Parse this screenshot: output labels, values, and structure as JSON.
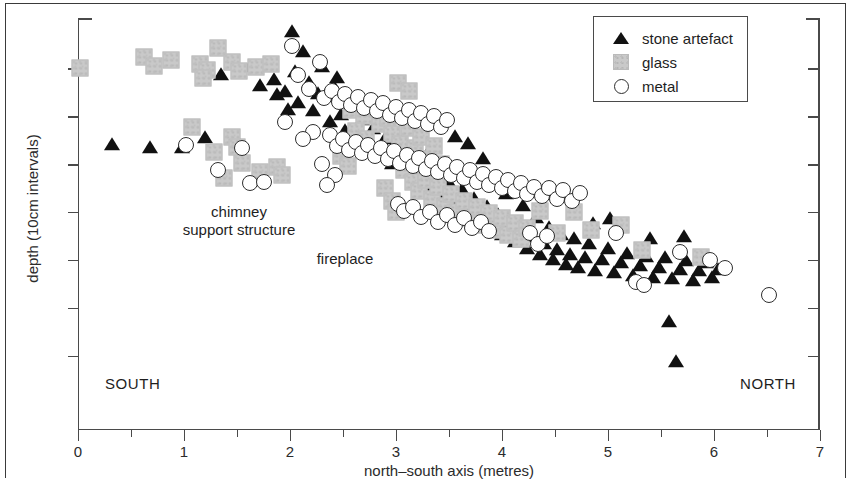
{
  "figure": {
    "x_axis_label": "north–south axis (metres)",
    "y_axis_label": "depth (10cm intervals)",
    "south_label": "SOUTH",
    "north_label": "NORTH"
  },
  "legend": {
    "items": [
      {
        "label": "stone artefact",
        "marker": "triangle-marker",
        "color": "#111111"
      },
      {
        "label": "glass",
        "marker": "square-marker",
        "color": "#c9c9c9"
      },
      {
        "label": "metal",
        "marker": "circle-marker",
        "color": "#ffffff"
      }
    ]
  },
  "annotations": [
    {
      "name": "chimney-support-structure",
      "line1": "chimney",
      "line2": "support structure"
    },
    {
      "name": "fireplace",
      "line1": "fireplace"
    }
  ],
  "chart_data": {
    "type": "scatter",
    "title": "",
    "xlabel": "north–south axis (metres)",
    "ylabel": "depth (10cm intervals)",
    "xlim": [
      0,
      7
    ],
    "ylim": [
      0,
      8.6
    ],
    "y_inverted": true,
    "grid": false,
    "legend_position": "top-right",
    "xticks": [
      0,
      1,
      2,
      3,
      4,
      5,
      6,
      7
    ],
    "xticklabels": [
      "0",
      "1",
      "2",
      "3",
      "4",
      "5",
      "6",
      "7"
    ],
    "xminorticks": [
      0.5,
      1.5,
      2.5,
      3.5,
      4.5,
      5.5,
      6.5
    ],
    "yticks": [
      1.05,
      2.05,
      3.05,
      4.05,
      5.05,
      6.05,
      7.05
    ],
    "yticklabels": [
      "",
      "",
      "",
      "",
      "",
      "",
      ""
    ],
    "series": [
      {
        "name": "stone artefact",
        "marker": "triangle",
        "color": "#111111",
        "points": [
          [
            0.32,
            2.65
          ],
          [
            0.68,
            2.72
          ],
          [
            0.98,
            2.72
          ],
          [
            1.2,
            2.5
          ],
          [
            1.35,
            1.18
          ],
          [
            1.52,
            2.62
          ],
          [
            1.62,
            1.02
          ],
          [
            1.78,
            0.97
          ],
          [
            1.72,
            1.42
          ],
          [
            1.85,
            1.3
          ],
          [
            1.88,
            1.6
          ],
          [
            1.95,
            1.55
          ],
          [
            2.02,
            0.3
          ],
          [
            2.05,
            1.12
          ],
          [
            2.08,
            1.78
          ],
          [
            2.12,
            0.72
          ],
          [
            2.18,
            1.35
          ],
          [
            2.22,
            1.95
          ],
          [
            2.3,
            1.02
          ],
          [
            2.33,
            1.62
          ],
          [
            2.38,
            2.18
          ],
          [
            2.42,
            1.48
          ],
          [
            2.48,
            2.02
          ],
          [
            2.52,
            2.35
          ],
          [
            2.58,
            1.72
          ],
          [
            2.62,
            2.55
          ],
          [
            2.68,
            2.12
          ],
          [
            2.72,
            2.62
          ],
          [
            2.78,
            2.32
          ],
          [
            2.84,
            2.88
          ],
          [
            2.9,
            2.52
          ],
          [
            2.96,
            3.05
          ],
          [
            3.02,
            2.78
          ],
          [
            3.08,
            3.2
          ],
          [
            3.14,
            2.95
          ],
          [
            3.2,
            3.38
          ],
          [
            3.26,
            3.12
          ],
          [
            3.32,
            3.55
          ],
          [
            3.38,
            3.28
          ],
          [
            3.44,
            3.72
          ],
          [
            3.5,
            3.44
          ],
          [
            3.56,
            2.48
          ],
          [
            3.58,
            3.88
          ],
          [
            3.62,
            3.6
          ],
          [
            3.68,
            2.62
          ],
          [
            3.7,
            4.05
          ],
          [
            3.74,
            3.78
          ],
          [
            3.8,
            4.2
          ],
          [
            3.82,
            2.95
          ],
          [
            3.86,
            3.95
          ],
          [
            3.92,
            4.35
          ],
          [
            3.96,
            4.12
          ],
          [
            4.0,
            4.52
          ],
          [
            4.04,
            3.68
          ],
          [
            4.08,
            4.28
          ],
          [
            4.12,
            4.68
          ],
          [
            4.16,
            4.42
          ],
          [
            4.2,
            3.92
          ],
          [
            4.24,
            4.82
          ],
          [
            4.28,
            4.58
          ],
          [
            4.32,
            4.18
          ],
          [
            4.36,
            4.95
          ],
          [
            4.4,
            4.72
          ],
          [
            4.44,
            4.38
          ],
          [
            4.48,
            5.05
          ],
          [
            4.52,
            4.85
          ],
          [
            4.56,
            4.52
          ],
          [
            4.6,
            5.15
          ],
          [
            4.64,
            4.95
          ],
          [
            4.68,
            4.62
          ],
          [
            4.72,
            5.22
          ],
          [
            4.78,
            5.02
          ],
          [
            4.82,
            4.72
          ],
          [
            4.88,
            5.28
          ],
          [
            4.94,
            5.05
          ],
          [
            5.0,
            4.82
          ],
          [
            5.06,
            5.32
          ],
          [
            5.12,
            5.12
          ],
          [
            5.18,
            4.92
          ],
          [
            5.24,
            5.38
          ],
          [
            5.3,
            5.18
          ],
          [
            5.36,
            4.98
          ],
          [
            5.42,
            5.42
          ],
          [
            5.48,
            5.22
          ],
          [
            5.54,
            5.02
          ],
          [
            5.58,
            6.35
          ],
          [
            5.6,
            5.45
          ],
          [
            5.64,
            7.18
          ],
          [
            5.68,
            5.25
          ],
          [
            5.74,
            5.08
          ],
          [
            5.8,
            5.48
          ],
          [
            5.86,
            5.28
          ],
          [
            5.92,
            5.12
          ],
          [
            5.98,
            5.42
          ],
          [
            6.04,
            5.25
          ],
          [
            4.86,
            4.3
          ],
          [
            5.02,
            4.2
          ],
          [
            5.4,
            4.62
          ],
          [
            5.72,
            4.58
          ],
          [
            3.3,
            2.82
          ],
          [
            3.46,
            3.02
          ],
          [
            2.44,
            1.25
          ],
          [
            1.98,
            1.92
          ],
          [
            2.26,
            1.58
          ]
        ]
      },
      {
        "name": "glass",
        "marker": "square",
        "color": "#c9c9c9",
        "points": [
          [
            0.02,
            1.05
          ],
          [
            0.62,
            0.82
          ],
          [
            0.72,
            1.0
          ],
          [
            0.88,
            0.88
          ],
          [
            1.15,
            0.95
          ],
          [
            1.22,
            1.08
          ],
          [
            1.32,
            0.62
          ],
          [
            1.45,
            0.92
          ],
          [
            1.52,
            1.1
          ],
          [
            1.08,
            2.28
          ],
          [
            1.28,
            2.8
          ],
          [
            1.45,
            2.48
          ],
          [
            1.5,
            2.7
          ],
          [
            1.55,
            3.02
          ],
          [
            1.72,
            3.22
          ],
          [
            1.88,
            3.12
          ],
          [
            1.92,
            3.28
          ],
          [
            1.68,
            1.02
          ],
          [
            1.82,
            0.95
          ],
          [
            2.58,
            1.92
          ],
          [
            2.7,
            2.05
          ],
          [
            2.78,
            1.88
          ],
          [
            2.85,
            2.22
          ],
          [
            2.92,
            2.08
          ],
          [
            2.62,
            2.35
          ],
          [
            2.72,
            2.52
          ],
          [
            2.96,
            2.42
          ],
          [
            3.04,
            2.62
          ],
          [
            3.12,
            2.3
          ],
          [
            3.18,
            2.72
          ],
          [
            3.24,
            2.48
          ],
          [
            3.3,
            2.95
          ],
          [
            3.36,
            2.68
          ],
          [
            3.42,
            3.05
          ],
          [
            3.08,
            3.18
          ],
          [
            3.16,
            3.42
          ],
          [
            3.22,
            3.62
          ],
          [
            3.28,
            3.38
          ],
          [
            3.34,
            3.78
          ],
          [
            3.4,
            3.52
          ],
          [
            3.46,
            3.92
          ],
          [
            3.52,
            3.68
          ],
          [
            3.58,
            4.05
          ],
          [
            3.64,
            3.82
          ],
          [
            3.7,
            4.18
          ],
          [
            3.76,
            3.95
          ],
          [
            3.82,
            4.32
          ],
          [
            3.88,
            4.08
          ],
          [
            3.94,
            4.42
          ],
          [
            4.0,
            4.18
          ],
          [
            4.06,
            4.52
          ],
          [
            4.12,
            4.28
          ],
          [
            4.18,
            4.62
          ],
          [
            4.24,
            4.38
          ],
          [
            3.02,
            1.35
          ],
          [
            3.12,
            1.52
          ],
          [
            2.48,
            2.88
          ],
          [
            2.55,
            3.08
          ],
          [
            4.36,
            4.02
          ],
          [
            4.52,
            4.48
          ],
          [
            4.68,
            4.05
          ],
          [
            4.84,
            4.42
          ],
          [
            5.12,
            4.32
          ],
          [
            5.32,
            4.85
          ],
          [
            5.88,
            4.98
          ],
          [
            2.9,
            3.55
          ],
          [
            2.96,
            3.82
          ],
          [
            3.0,
            4.05
          ],
          [
            1.18,
            1.25
          ],
          [
            1.38,
            3.35
          ]
        ]
      },
      {
        "name": "metal",
        "marker": "circle",
        "color": "#ffffff",
        "points": [
          [
            1.02,
            2.65
          ],
          [
            1.32,
            3.18
          ],
          [
            1.62,
            3.45
          ],
          [
            1.75,
            3.42
          ],
          [
            1.55,
            2.72
          ],
          [
            2.02,
            0.58
          ],
          [
            2.28,
            0.92
          ],
          [
            2.18,
            1.48
          ],
          [
            2.32,
            1.68
          ],
          [
            2.4,
            1.52
          ],
          [
            2.46,
            1.75
          ],
          [
            2.52,
            1.58
          ],
          [
            2.58,
            1.82
          ],
          [
            2.64,
            1.65
          ],
          [
            2.7,
            1.88
          ],
          [
            2.76,
            1.72
          ],
          [
            2.82,
            1.95
          ],
          [
            2.88,
            1.78
          ],
          [
            2.94,
            2.02
          ],
          [
            3.0,
            1.85
          ],
          [
            3.06,
            2.08
          ],
          [
            3.12,
            1.92
          ],
          [
            3.18,
            2.15
          ],
          [
            3.24,
            1.98
          ],
          [
            3.3,
            2.22
          ],
          [
            3.36,
            2.05
          ],
          [
            3.42,
            2.28
          ],
          [
            3.48,
            2.12
          ],
          [
            2.38,
            2.45
          ],
          [
            2.44,
            2.68
          ],
          [
            2.5,
            2.52
          ],
          [
            2.56,
            2.75
          ],
          [
            2.62,
            2.58
          ],
          [
            2.68,
            2.82
          ],
          [
            2.74,
            2.65
          ],
          [
            2.8,
            2.88
          ],
          [
            2.86,
            2.72
          ],
          [
            2.92,
            2.95
          ],
          [
            2.98,
            2.78
          ],
          [
            3.04,
            3.02
          ],
          [
            3.1,
            2.85
          ],
          [
            3.16,
            3.08
          ],
          [
            3.22,
            2.92
          ],
          [
            3.28,
            3.15
          ],
          [
            3.34,
            2.98
          ],
          [
            3.4,
            3.22
          ],
          [
            3.46,
            3.05
          ],
          [
            3.52,
            3.28
          ],
          [
            3.58,
            3.12
          ],
          [
            3.64,
            3.35
          ],
          [
            3.7,
            3.18
          ],
          [
            3.76,
            3.42
          ],
          [
            3.82,
            3.25
          ],
          [
            3.88,
            3.48
          ],
          [
            3.94,
            3.32
          ],
          [
            4.0,
            3.55
          ],
          [
            4.06,
            3.38
          ],
          [
            4.12,
            3.62
          ],
          [
            4.18,
            3.45
          ],
          [
            4.24,
            3.68
          ],
          [
            2.22,
            2.38
          ],
          [
            2.3,
            3.05
          ],
          [
            2.42,
            3.28
          ],
          [
            2.35,
            3.48
          ],
          [
            3.02,
            3.88
          ],
          [
            3.08,
            4.02
          ],
          [
            3.16,
            3.95
          ],
          [
            3.24,
            4.15
          ],
          [
            3.32,
            4.05
          ],
          [
            3.4,
            4.25
          ],
          [
            3.48,
            4.12
          ],
          [
            3.56,
            4.32
          ],
          [
            3.64,
            4.18
          ],
          [
            3.72,
            4.38
          ],
          [
            3.8,
            4.25
          ],
          [
            3.88,
            4.45
          ],
          [
            4.3,
            3.52
          ],
          [
            4.38,
            3.72
          ],
          [
            4.44,
            3.55
          ],
          [
            4.52,
            3.78
          ],
          [
            4.58,
            3.6
          ],
          [
            4.66,
            3.82
          ],
          [
            4.74,
            3.65
          ],
          [
            4.26,
            4.48
          ],
          [
            4.34,
            4.72
          ],
          [
            4.42,
            4.55
          ],
          [
            5.08,
            4.48
          ],
          [
            5.26,
            5.52
          ],
          [
            5.34,
            5.58
          ],
          [
            5.68,
            4.88
          ],
          [
            5.96,
            5.05
          ],
          [
            6.1,
            5.22
          ],
          [
            6.52,
            5.78
          ],
          [
            2.08,
            1.18
          ],
          [
            1.95,
            2.18
          ],
          [
            2.12,
            2.52
          ]
        ]
      }
    ]
  }
}
